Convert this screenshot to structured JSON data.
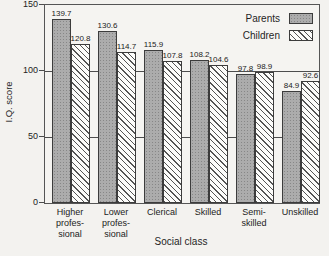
{
  "chart_data": {
    "type": "bar",
    "title": "",
    "xlabel": "Social class",
    "ylabel": "I.Q. score",
    "categories": [
      "Higher professional",
      "Lower professional",
      "Clerical",
      "Skilled",
      "Semi-skilled",
      "Unskilled"
    ],
    "category_display_lines": [
      [
        "Higher",
        "profes-",
        "sional"
      ],
      [
        "Lower",
        "profes-",
        "sional"
      ],
      [
        "Clerical"
      ],
      [
        "Skilled"
      ],
      [
        "Semi-",
        "skilled"
      ],
      [
        "Unskilled"
      ]
    ],
    "series": [
      {
        "name": "Parents",
        "pattern": "parents",
        "values": [
          139.7,
          130.6,
          115.9,
          108.2,
          97.8,
          84.9
        ]
      },
      {
        "name": "Children",
        "pattern": "children",
        "values": [
          120.8,
          114.7,
          107.8,
          104.6,
          98.9,
          92.6
        ]
      }
    ],
    "ylim": [
      0,
      150
    ],
    "yticks": [
      0,
      50,
      100,
      150
    ],
    "gridlines": [
      50,
      100
    ],
    "grid": "horizontal lines at 50 and 100, drawn behind opaque bars",
    "legend_position": "top-right inside plot",
    "value_labels": true
  },
  "colors": {
    "background": "#f3f2ef",
    "frame": "#555555",
    "parents_bar_fill": "#acacac",
    "children_bar_fill": "#fcfcfa",
    "hatch_line": "#4b4b4b",
    "text": "#1f1f1f"
  }
}
